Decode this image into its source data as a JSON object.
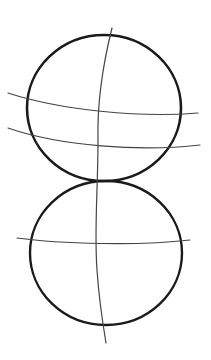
{
  "sketch": {
    "description": "Pencil sketch of two stacked circles with construction guide lines",
    "colors": {
      "background": "#ffffff",
      "stroke_dark": "#1a1a1a",
      "stroke_light": "#444444"
    },
    "top_circle": {
      "cx": 104,
      "cy": 108,
      "rx": 77,
      "ry": 73
    },
    "bottom_circle": {
      "cx": 106,
      "cy": 253,
      "rx": 76,
      "ry": 72
    },
    "vertical_guide": "M112,28 C104,60 97,100 98,140 C98,190 94,230 97,270 C99,300 103,325 106,343",
    "top_guides": [
      "M8,93 C60,110 140,118 198,113",
      "M8,128 C60,146 140,152 200,145"
    ],
    "bottom_guides": [
      "M17,238 C60,244 140,246 190,240"
    ]
  }
}
